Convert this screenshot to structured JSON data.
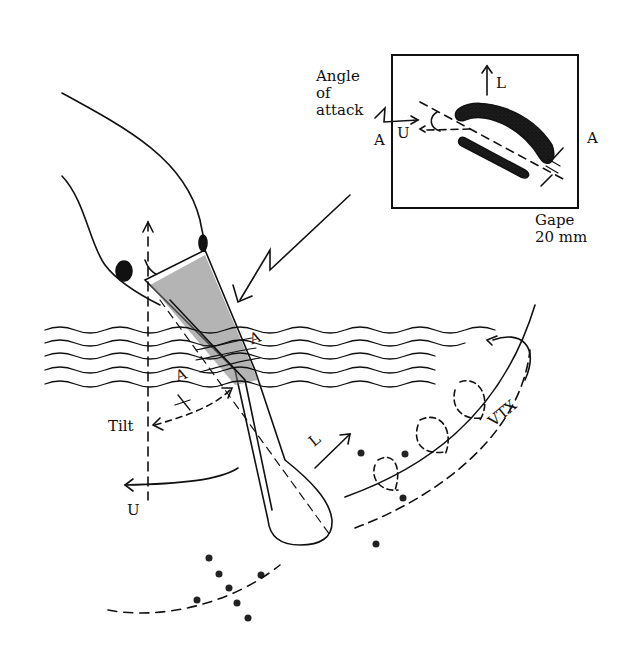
{
  "figure": {
    "type": "spoonbill-bill-hydrodynamics-diagram",
    "inset": {
      "angle_label": [
        "Angle",
        "of",
        "attack"
      ],
      "section_left": "A",
      "section_right": "A",
      "flow_label": "U",
      "lift_label": "L",
      "gape_label": [
        "Gape",
        "20 mm"
      ]
    },
    "main": {
      "section_marker_upper": "A",
      "section_marker_lower": "A",
      "tilt_label": "Tilt",
      "flow_label": "U",
      "lift_label": "L",
      "vortex_label": "VTX"
    }
  }
}
